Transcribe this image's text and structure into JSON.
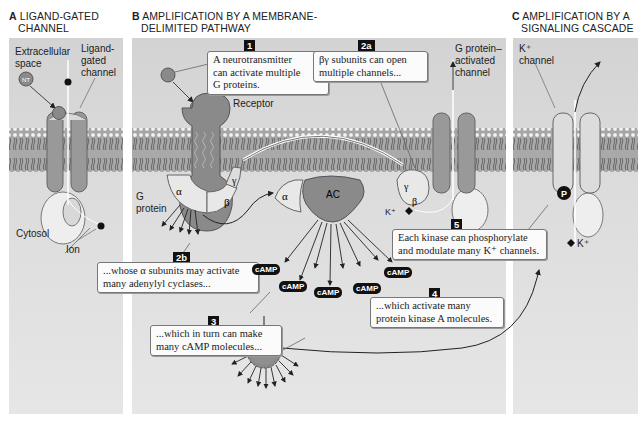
{
  "panels": {
    "a": {
      "letter": "A",
      "title_line1": "LIGAND-GATED",
      "title_line2": "CHANNEL",
      "labels": {
        "extracellular": "Extracellular",
        "space": "space",
        "lg1": "Ligand-",
        "lg2": "gated",
        "lg3": "channel",
        "cytosol": "Cytosol",
        "ion": "Ion",
        "nt": "NT"
      }
    },
    "b": {
      "letter": "B",
      "title_line1": "AMPLIFICATION BY A MEMBRANE-",
      "title_line2": "DELIMITED PATHWAY",
      "labels": {
        "receptor": "Receptor",
        "g": "G",
        "protein": "protein",
        "alpha": "α",
        "beta": "β",
        "gamma": "γ",
        "ac": "AC",
        "gpa1": "G protein–",
        "gpa2": "activated",
        "gpa3": "channel",
        "kplus": "K⁺",
        "pka": "PKA",
        "nt": "NT"
      }
    },
    "c": {
      "letter": "C",
      "title_line1": "AMPLIFICATION BY A",
      "title_line2": "SIGNALING CASCADE",
      "labels": {
        "k1": "K⁺",
        "k2": "channel",
        "p": "P",
        "kplus": "K⁺"
      }
    }
  },
  "callouts": [
    {
      "num": "1",
      "line1": "A neurotransmitter",
      "line2": "can activate multiple",
      "line3": "G proteins."
    },
    {
      "num": "2a",
      "line1": "βγ subunits can open",
      "line2": "multiple channels..."
    },
    {
      "num": "2b",
      "line1": "...whose α subunits may activate",
      "line2": "many adenylyl cyclases..."
    },
    {
      "num": "3",
      "line1": "...which in turn can make",
      "line2": "many cAMP molecules..."
    },
    {
      "num": "4",
      "line1": "...which activate many",
      "line2": "protein kinase A molecules."
    },
    {
      "num": "5",
      "line1": "Each kinase can phosphorylate",
      "line2": "and modulate many K⁺ channels."
    }
  ],
  "camp_label": "cAMP",
  "colors": {
    "panel_bg": "#d8d8d8",
    "protein": "#8c8c8c",
    "subunit": "#e8e8e8",
    "callout_bg": "#fbfbfb",
    "badge": "#111111"
  }
}
